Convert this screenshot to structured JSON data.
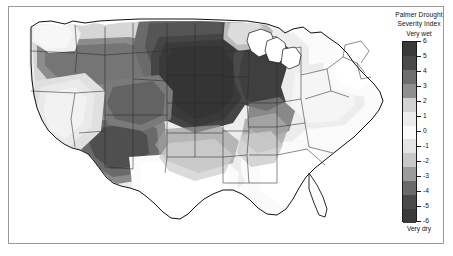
{
  "figure": {
    "background_color": "#ffffff",
    "frame_color": "#9a9a9a"
  },
  "legend": {
    "title_line1": "Palmer Drought",
    "title_line2": "Severity Index",
    "top_label": "Very wet",
    "bottom_label": "Very dry",
    "tick_labels": [
      "6",
      "5",
      "4",
      "3",
      "2",
      "1",
      "0",
      "-1",
      "-2",
      "-3",
      "-4",
      "-5",
      "-6"
    ]
  },
  "chart_data": {
    "type": "heatmap",
    "title": "Palmer Drought Severity Index",
    "subtitle": "",
    "xlabel": "",
    "ylabel": "",
    "map_region": "Contiguous United States",
    "projection": "albers-usa",
    "colorbar": {
      "orientation": "vertical",
      "position": "right",
      "label": "Palmer Drought Severity Index",
      "min": -6,
      "max": 6,
      "min_label": "Very dry",
      "max_label": "Very wet",
      "tick_values": [
        6,
        5,
        4,
        3,
        2,
        1,
        0,
        -1,
        -2,
        -3,
        -4,
        -5,
        -6
      ],
      "colormap": "grayscale-diverging",
      "bands": [
        {
          "range": [
            5,
            6
          ],
          "color": "#3a3a3a"
        },
        {
          "range": [
            4,
            5
          ],
          "color": "#4a4a4a"
        },
        {
          "range": [
            3,
            4
          ],
          "color": "#6e6e6e"
        },
        {
          "range": [
            2,
            3
          ],
          "color": "#8f8f8f"
        },
        {
          "range": [
            1,
            2
          ],
          "color": "#d2d2d2"
        },
        {
          "range": [
            0,
            1
          ],
          "color": "#ececec"
        },
        {
          "range": [
            -1,
            0
          ],
          "color": "#fafafa"
        },
        {
          "range": [
            -2,
            -1
          ],
          "color": "#e4e4e4"
        },
        {
          "range": [
            -3,
            -2
          ],
          "color": "#c8c8c8"
        },
        {
          "range": [
            -4,
            -3
          ],
          "color": "#9b9b9b"
        },
        {
          "range": [
            -5,
            -4
          ],
          "color": "#6a6a6a"
        },
        {
          "range": [
            -6,
            -5
          ],
          "color": "#4a4a4a"
        },
        {
          "range": [
            -6.5,
            -6
          ],
          "color": "#3a3a3a"
        }
      ]
    },
    "grid": false,
    "legend_position": "right",
    "regions": [
      {
        "name": "Washington",
        "value": 1.5,
        "shade": "#e3e3e3"
      },
      {
        "name": "Oregon",
        "value": 3.5,
        "shade": "#6e6e6e"
      },
      {
        "name": "Idaho",
        "value": 3.5,
        "shade": "#6e6e6e"
      },
      {
        "name": "Montana",
        "value": 3.0,
        "shade": "#7e7e7e"
      },
      {
        "name": "Wyoming",
        "value": 3.0,
        "shade": "#7e7e7e"
      },
      {
        "name": "North Dakota",
        "value": 4.5,
        "shade": "#555555"
      },
      {
        "name": "South Dakota",
        "value": 5.5,
        "shade": "#3d3d3d"
      },
      {
        "name": "Nebraska",
        "value": 5.8,
        "shade": "#373737"
      },
      {
        "name": "Iowa",
        "value": 5.8,
        "shade": "#373737"
      },
      {
        "name": "Minnesota",
        "value": 4.0,
        "shade": "#606060"
      },
      {
        "name": "Wisconsin",
        "value": 2.0,
        "shade": "#b5b5b5"
      },
      {
        "name": "Illinois",
        "value": 5.0,
        "shade": "#454545"
      },
      {
        "name": "Missouri",
        "value": 5.5,
        "shade": "#3d3d3d"
      },
      {
        "name": "Kansas",
        "value": 5.5,
        "shade": "#3d3d3d"
      },
      {
        "name": "Oklahoma",
        "value": 3.5,
        "shade": "#6e6e6e"
      },
      {
        "name": "Colorado",
        "value": 4.0,
        "shade": "#5a5a5a"
      },
      {
        "name": "Utah",
        "value": 3.5,
        "shade": "#6e6e6e"
      },
      {
        "name": "Nevada",
        "value": 1.0,
        "shade": "#e0e0e0"
      },
      {
        "name": "California",
        "value": 0.8,
        "shade": "#e8e8e8"
      },
      {
        "name": "Arizona",
        "value": 4.5,
        "shade": "#4f4f4f"
      },
      {
        "name": "New Mexico",
        "value": 4.5,
        "shade": "#4f4f4f"
      },
      {
        "name": "Texas",
        "value": 0.3,
        "shade": "#f4f4f4"
      },
      {
        "name": "Louisiana",
        "value": 0.5,
        "shade": "#efefef"
      },
      {
        "name": "Arkansas",
        "value": 2.5,
        "shade": "#9e9e9e"
      },
      {
        "name": "Mississippi",
        "value": 0.5,
        "shade": "#f2f2f2"
      },
      {
        "name": "Alabama",
        "value": 0.3,
        "shade": "#f6f6f6"
      },
      {
        "name": "Tennessee",
        "value": 2.0,
        "shade": "#bdbdbd"
      },
      {
        "name": "Kentucky",
        "value": 3.0,
        "shade": "#9a9a9a"
      },
      {
        "name": "Indiana",
        "value": 4.5,
        "shade": "#4f4f4f"
      },
      {
        "name": "Ohio",
        "value": 2.5,
        "shade": "#a8a8a8"
      },
      {
        "name": "Michigan",
        "value": 4.5,
        "shade": "#4f4f4f"
      },
      {
        "name": "Georgia",
        "value": 0.8,
        "shade": "#e8e8e8"
      },
      {
        "name": "Florida",
        "value": 1.0,
        "shade": "#dedede"
      },
      {
        "name": "South Carolina",
        "value": 0.8,
        "shade": "#e6e6e6"
      },
      {
        "name": "North Carolina",
        "value": 1.0,
        "shade": "#dfdfdf"
      },
      {
        "name": "Virginia",
        "value": 1.2,
        "shade": "#d8d8d8"
      },
      {
        "name": "West Virginia",
        "value": 1.5,
        "shade": "#d0d0d0"
      },
      {
        "name": "Pennsylvania",
        "value": 1.2,
        "shade": "#dadada"
      },
      {
        "name": "New York",
        "value": 0.8,
        "shade": "#e8e8e8"
      },
      {
        "name": "Maine",
        "value": 0.2,
        "shade": "#f8f8f8"
      },
      {
        "name": "Vermont",
        "value": 0.3,
        "shade": "#f5f5f5"
      },
      {
        "name": "New Hampshire",
        "value": 0.3,
        "shade": "#f5f5f5"
      },
      {
        "name": "Massachusetts",
        "value": 0.3,
        "shade": "#f6f6f6"
      },
      {
        "name": "Connecticut",
        "value": 0.4,
        "shade": "#f2f2f2"
      },
      {
        "name": "Rhode Island",
        "value": 0.4,
        "shade": "#f2f2f2"
      },
      {
        "name": "New Jersey",
        "value": 0.8,
        "shade": "#e8e8e8"
      },
      {
        "name": "Delaware",
        "value": 0.8,
        "shade": "#e8e8e8"
      },
      {
        "name": "Maryland",
        "value": 1.0,
        "shade": "#e0e0e0"
      }
    ]
  }
}
